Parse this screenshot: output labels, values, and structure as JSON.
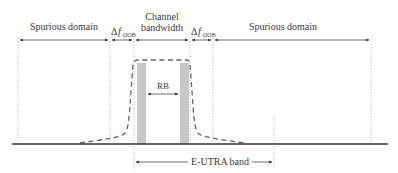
{
  "labels": {
    "spurious_left": "Spurious domain",
    "spurious_right": "Spurious domain",
    "delta_symbol": "Δ",
    "f_symbol": "f",
    "oob_subscript": "OOB",
    "channel_line1": "Channel",
    "channel_line2": "bandwidth",
    "rb": "RB",
    "eutra_band": "E-UTRA band"
  },
  "colors": {
    "line": "#333333",
    "dotted": "#bbbbbb",
    "mask": "#666666",
    "rb_bar": "#c8c8c8",
    "text": "#3a3a3a"
  }
}
